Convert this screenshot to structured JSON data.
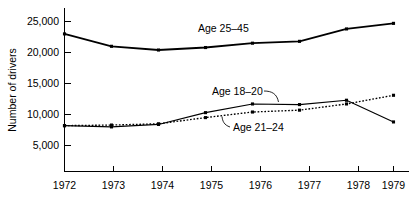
{
  "chart_data": {
    "type": "line",
    "title": "",
    "xlabel": "",
    "ylabel": "Number of drivers",
    "categories": [
      "1972",
      "1973",
      "1974",
      "1975",
      "1976",
      "1977",
      "1978",
      "1979"
    ],
    "x": [
      1972,
      1973,
      1974,
      1975,
      1976,
      1977,
      1978,
      1979
    ],
    "xlim": [
      1972,
      1979
    ],
    "ylim": [
      0,
      26500
    ],
    "yticks": [
      5000,
      10000,
      15000,
      20000,
      25000
    ],
    "ytick_labels": [
      "5,000",
      "10,000",
      "15,000",
      "20,000",
      "25,000"
    ],
    "grid": false,
    "legend_position": "inline-annotations",
    "series": [
      {
        "name": "Age 25-45",
        "label": "Age 25–45",
        "style": "solid-thick",
        "color": "#000000",
        "values": [
          23000,
          21000,
          20400,
          20800,
          21500,
          21800,
          23800,
          24700
        ]
      },
      {
        "name": "Age 18-20",
        "label": "Age 18–20",
        "style": "solid-thin",
        "color": "#000000",
        "values": [
          8200,
          8000,
          8400,
          10300,
          11700,
          11600,
          12300,
          8800
        ]
      },
      {
        "name": "Age 21-24",
        "label": "Age 21–24",
        "style": "dotted",
        "color": "#000000",
        "values": [
          8200,
          8300,
          8500,
          9500,
          10400,
          10700,
          11700,
          13100
        ]
      }
    ],
    "annotations": [
      {
        "text": "Age 25–45",
        "series": "Age 25-45",
        "leader": false
      },
      {
        "text": "Age 18–20",
        "series": "Age 18-20",
        "leader": true
      },
      {
        "text": "Age 21–24",
        "series": "Age 21-24",
        "leader": true
      }
    ]
  },
  "axes": {
    "y_title": "Number of drivers",
    "y_tick_0": "5,000",
    "y_tick_1": "10,000",
    "y_tick_2": "15,000",
    "y_tick_3": "20,000",
    "y_tick_4": "25,000",
    "x_tick_0": "1972",
    "x_tick_1": "1973",
    "x_tick_2": "1974",
    "x_tick_3": "1975",
    "x_tick_4": "1976",
    "x_tick_5": "1977",
    "x_tick_6": "1978",
    "x_tick_7": "1979"
  },
  "labels": {
    "age_25_45": "Age 25–45",
    "age_18_20": "Age 18–20",
    "age_21_24": "Age 21–24"
  }
}
